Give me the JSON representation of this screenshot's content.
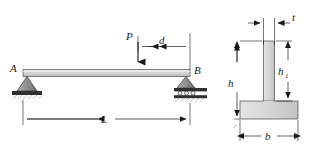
{
  "figure": {
    "kind": "engineering-beam-and-cross-section-diagram",
    "background_color": "#ffffff",
    "line_color": "#1a1a1a",
    "fill_color": "#d2d2d2",
    "support_fill_color": "#8a8a8a",
    "ground_fill_color": "#3d3d3d"
  },
  "beam_diagram": {
    "labels": {
      "support_a": "A",
      "support_b": "B",
      "load": "P",
      "distance_d": "d",
      "span_l": "L"
    }
  },
  "cross_section": {
    "labels": {
      "thickness": "t",
      "total_height": "h",
      "web_height": "h",
      "web_height_sub": "1",
      "flange_width": "b"
    }
  }
}
